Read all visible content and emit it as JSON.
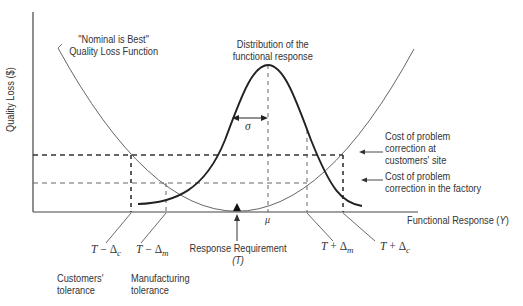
{
  "diagram": {
    "title_loss_function": [
      "\"Nominal is Best\"",
      "Quality Loss Function"
    ],
    "title_distribution": [
      "Distribution of the",
      "functional response"
    ],
    "y_axis_label": "Quality Loss ($)",
    "x_axis_label": "Functional Response (",
    "x_axis_var": "Y",
    "x_axis_close": ")",
    "sigma_label": "σ",
    "mu_label": "μ",
    "cost_customer_site": [
      "Cost of problem",
      "correction at",
      "customers' site"
    ],
    "cost_factory": [
      "Cost of problem",
      "correction in the factory"
    ],
    "response_requirement": "Response Requirement",
    "response_requirement_symbol": "(T)",
    "tolerance_labels": {
      "t_minus_dc": {
        "T": "T",
        "op": " − Δ",
        "sub": "c"
      },
      "t_minus_dm": {
        "T": "T",
        "op": " − Δ",
        "sub": "m"
      },
      "t_plus_dm": {
        "T": "T",
        "op": " + Δ",
        "sub": "m"
      },
      "t_plus_dc": {
        "T": "T",
        "op": " + Δ",
        "sub": "c"
      }
    },
    "customers_tolerance": [
      "Customers'",
      "tolerance"
    ],
    "manufacturing_tolerance": [
      "Manufacturing",
      "tolerance"
    ],
    "colors": {
      "line": "#333333",
      "thin_line": "#555555",
      "background": "#ffffff"
    }
  }
}
